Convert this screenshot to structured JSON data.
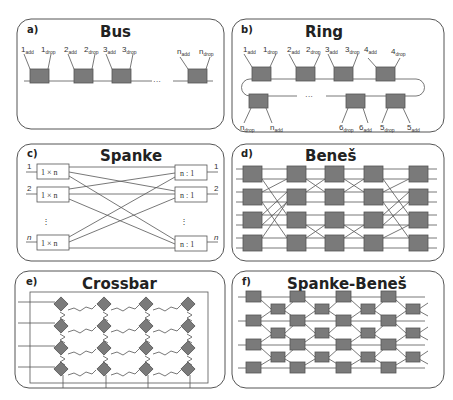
{
  "figure": {
    "panels": [
      {
        "id": "a",
        "label": "a)",
        "title": "Bus",
        "nodes": [
          {
            "add": "1",
            "drop": "1"
          },
          {
            "add": "2",
            "drop": "2"
          },
          {
            "add": "3",
            "drop": "3"
          },
          {
            "add": "n",
            "drop": "n"
          }
        ],
        "ellipsis": "···",
        "sub_add": "add",
        "sub_drop": "drop"
      },
      {
        "id": "b",
        "label": "b)",
        "title": "Ring",
        "top_nodes": [
          {
            "add": "1",
            "drop": "1"
          },
          {
            "add": "2",
            "drop": "2"
          },
          {
            "add": "3",
            "drop": "3"
          },
          {
            "add": "4",
            "drop": "4"
          }
        ],
        "bottom_nodes": [
          {
            "drop": "n",
            "add": "n"
          },
          {
            "drop": "6",
            "add": "6"
          },
          {
            "drop": "5",
            "add": "5"
          }
        ],
        "ellipsis": "···",
        "sub_add": "add",
        "sub_drop": "drop"
      },
      {
        "id": "c",
        "label": "c)",
        "title": "Spanke",
        "inputs": [
          "1",
          "2",
          "n"
        ],
        "outputs": [
          "1",
          "2",
          "n"
        ],
        "splitter": "1 × n",
        "combiner": "n : 1",
        "vdots": "⋮"
      },
      {
        "id": "d",
        "label": "d)",
        "title": "Beneš",
        "stages": 5,
        "switches_per_stage": 4
      },
      {
        "id": "e",
        "label": "e)",
        "title": "Crossbar",
        "rows": 4,
        "cols": 4
      },
      {
        "id": "f",
        "label": "f)",
        "title": "Spanke-Beneš",
        "columns": 8
      }
    ]
  }
}
